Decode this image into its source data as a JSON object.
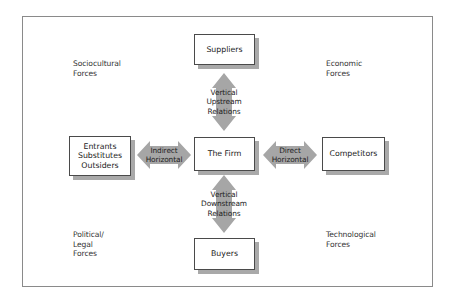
{
  "diagram": {
    "forces": {
      "top_left": "Sociocultural\nForces",
      "top_right": "Economic\nForces",
      "bottom_left": "Political/\nLegal\nForces",
      "bottom_right": "Technological\nForces"
    },
    "nodes": {
      "suppliers": "Suppliers",
      "firm": "The Firm",
      "entrants": "Entrants\nSubstitutes\nOutsiders",
      "competitors": "Competitors",
      "buyers": "Buyers"
    },
    "relations": {
      "upstream": "Vertical\nUpstream\nRelations",
      "downstream": "Vertical\nDownstream\nRelations",
      "indirect": "Indirect\nHorizontal",
      "direct": "Direct\nHorizontal"
    },
    "colors": {
      "arrow_fill": "#a6a6a6",
      "box_border": "#4a4a4a",
      "box_shadow": "#a9a9a9",
      "frame_border": "#8a8a8a"
    }
  }
}
